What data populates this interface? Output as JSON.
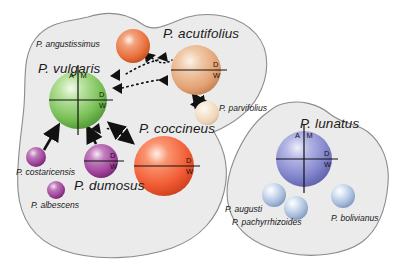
{
  "figure": {
    "background": "#ffffff",
    "pool_fill": "#ebebeb",
    "pool_stroke": "#8c8c8c",
    "axis_labels": {
      "a": "A",
      "m": "M",
      "d": "D",
      "w": "W"
    }
  },
  "pools": [
    {
      "name": "mesoamerican-andean-pool",
      "label": ""
    },
    {
      "name": "lunatus-pool",
      "label": ""
    }
  ],
  "species": [
    {
      "id": "angustissimus",
      "label": "P. angustissimus",
      "color": "#e8703c",
      "radius": 17,
      "cx": 133,
      "cy": 46,
      "domesticated": false,
      "label_x": 36,
      "label_y": 40,
      "label_size": "sm"
    },
    {
      "id": "acutifolius",
      "label": "P. acutifolius",
      "color": "#e8a779",
      "radius": 25,
      "cx": 196,
      "cy": 70,
      "domesticated": true,
      "axes": "dw",
      "label_x": 163,
      "label_y": 27,
      "label_size": "lg"
    },
    {
      "id": "parvifolius",
      "label": "P. parvifolius",
      "color": "#f2dcc4",
      "radius": 12,
      "cx": 207,
      "cy": 113,
      "domesticated": false,
      "label_x": 219,
      "label_y": 104,
      "label_size": "sm"
    },
    {
      "id": "vulgaris",
      "label": "P. vulgaris",
      "color": "#7dc45a",
      "radius": 29,
      "cx": 78,
      "cy": 100,
      "domesticated": true,
      "axes": "amdw",
      "label_x": 38,
      "label_y": 62,
      "label_size": "lg"
    },
    {
      "id": "coccineus",
      "label": "P. coccineus",
      "color": "#f05a32",
      "radius": 30,
      "cx": 164,
      "cy": 166,
      "domesticated": true,
      "axes": "dw",
      "label_x": 139,
      "label_y": 122,
      "label_size": "lg"
    },
    {
      "id": "dumosus",
      "label": "P. dumosus",
      "color": "#a0439b",
      "radius": 17,
      "cx": 101,
      "cy": 161,
      "domesticated": true,
      "axes": "dw",
      "label_x": 74,
      "label_y": 179,
      "label_size": "lg"
    },
    {
      "id": "costaricensis",
      "label": "P. costaricensis",
      "color": "#9b3f96",
      "radius": 10,
      "cx": 36,
      "cy": 157,
      "domesticated": false,
      "label_x": 16,
      "label_y": 168,
      "label_size": "sm"
    },
    {
      "id": "albescens",
      "label": "P. albescens",
      "color": "#9b3f96",
      "radius": 9,
      "cx": 56,
      "cy": 190,
      "domesticated": false,
      "label_x": 31,
      "label_y": 201,
      "label_size": "sm"
    },
    {
      "id": "lunatus",
      "label": "P. lunatus",
      "color": "#8d8fd0",
      "radius": 28,
      "cx": 304,
      "cy": 159,
      "domesticated": true,
      "axes": "amdw",
      "label_x": 300,
      "label_y": 117,
      "label_size": "lg"
    },
    {
      "id": "augusti",
      "label": "P. augusti",
      "color": "#a9bcdd",
      "radius": 12,
      "cx": 274,
      "cy": 195,
      "domesticated": false,
      "label_x": 225,
      "label_y": 205,
      "label_size": "sm"
    },
    {
      "id": "pachyrrhizoides",
      "label": "P. pachyrrhizoides",
      "color": "#a9bcdd",
      "radius": 12,
      "cx": 296,
      "cy": 208,
      "domesticated": false,
      "label_x": 232,
      "label_y": 218,
      "label_size": "sm"
    },
    {
      "id": "bolivianus",
      "label": "P. bolivianus",
      "color": "#a9bcdd",
      "radius": 12,
      "cx": 343,
      "cy": 196,
      "domesticated": false,
      "label_x": 331,
      "label_y": 214,
      "label_size": "sm"
    }
  ],
  "arrows": [
    {
      "name": "angustissimus-to-acutifolius",
      "style": "dotted",
      "from": "angustissimus",
      "to": "acutifolius"
    },
    {
      "name": "acutifolius-to-vulgaris",
      "style": "dotted",
      "from": "acutifolius",
      "to": "vulgaris"
    },
    {
      "name": "acutifolius-to-angustissimus",
      "style": "dotted",
      "from": "acutifolius",
      "to": "angustissimus"
    },
    {
      "name": "acutifolius-parvifolius",
      "style": "solid-double",
      "from": "acutifolius",
      "to": "parvifolius"
    },
    {
      "name": "costaricensis-to-vulgaris",
      "style": "solid",
      "from": "costaricensis",
      "to": "vulgaris"
    },
    {
      "name": "dumosus-to-vulgaris",
      "style": "solid",
      "from": "dumosus",
      "to": "vulgaris"
    },
    {
      "name": "coccineus-vulgaris",
      "style": "solid-double",
      "from": "coccineus",
      "to": "vulgaris"
    },
    {
      "name": "coccineus-to-vulgaris-dotted",
      "style": "dotted",
      "from": "coccineus",
      "to": "vulgaris"
    }
  ]
}
